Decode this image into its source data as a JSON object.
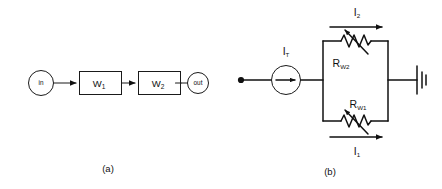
{
  "figure": {
    "background_color": "#ffffff",
    "line_color": "#1a1a1a",
    "panels": [
      {
        "id": "a",
        "caption": "(a)",
        "type": "block-diagram",
        "nodes": [
          {
            "name": "input-node",
            "label": "in",
            "shape": "circle"
          },
          {
            "name": "block-w1",
            "label": "W",
            "subscript": "1",
            "shape": "rectangle"
          },
          {
            "name": "block-w2",
            "label": "W",
            "subscript": "2",
            "shape": "rectangle"
          },
          {
            "name": "output-node",
            "label": "out",
            "shape": "circle"
          }
        ],
        "connections": [
          {
            "from": "in",
            "to": "W1",
            "style": "arrow"
          },
          {
            "from": "W1",
            "to": "W2",
            "style": "arrow"
          },
          {
            "from": "W2",
            "to": "out",
            "style": "arrow"
          }
        ]
      },
      {
        "id": "b",
        "caption": "(b)",
        "type": "circuit-diagram",
        "source": {
          "name": "current-source",
          "label": "I",
          "subscript": "T",
          "symbol": "circle-with-arrow"
        },
        "terminal": {
          "name": "input-terminal",
          "symbol": "filled-dot"
        },
        "branches": [
          {
            "name": "top-branch",
            "component_label": "R",
            "component_subscript": "W2",
            "component_type": "variable-resistor",
            "current_label": "I",
            "current_subscript": "2",
            "current_arrow_direction": "right"
          },
          {
            "name": "bottom-branch",
            "component_label": "R",
            "component_subscript": "W1",
            "component_type": "variable-resistor",
            "current_label": "I",
            "current_subscript": "1",
            "current_arrow_direction": "right"
          }
        ],
        "ground": {
          "name": "ground-symbol",
          "symbol": "ground-bars"
        }
      }
    ]
  }
}
